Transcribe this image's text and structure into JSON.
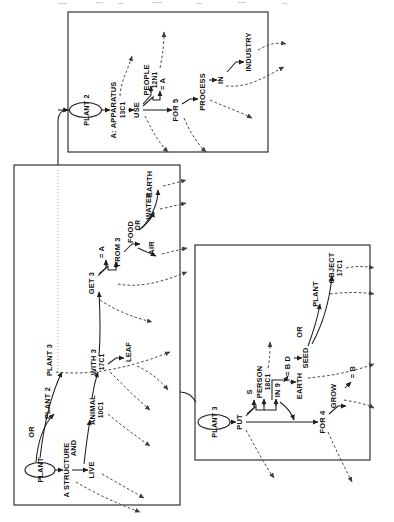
{
  "figure": {
    "orientation_deg": 90,
    "panels": [
      {
        "id": "panel-1",
        "name": "apparatus-panel",
        "x": 68,
        "y": 12,
        "w": 200,
        "h": 140
      },
      {
        "id": "panel-2",
        "name": "plant-structure-panel",
        "x": 14,
        "y": 165,
        "w": 166,
        "h": 340
      },
      {
        "id": "panel-3",
        "name": "planting-panel",
        "x": 195,
        "y": 245,
        "w": 175,
        "h": 215
      }
    ]
  },
  "panel1": {
    "root": "PLANT 2",
    "nodes": [
      {
        "name": "apparatus",
        "label": "A: APPARATUS",
        "code": "13C1"
      },
      {
        "name": "use",
        "label": "USE",
        "code": ""
      },
      {
        "name": "people",
        "label": "PEOPLE",
        "code": "12N1"
      },
      {
        "name": "equals-a",
        "label": "= A",
        "code": ""
      },
      {
        "name": "for-5",
        "label": "FOR 5",
        "code": ""
      },
      {
        "name": "process",
        "label": "PROCESS",
        "code": ""
      },
      {
        "name": "in",
        "label": "IN",
        "code": ""
      },
      {
        "name": "industry",
        "label": "INDUSTRY",
        "code": ""
      }
    ]
  },
  "panel2": {
    "root": "PLANT",
    "nodes": [
      {
        "name": "a-structure",
        "label": "A STRUCTURE",
        "code": ""
      },
      {
        "name": "and",
        "label": "AND",
        "code": ""
      },
      {
        "name": "or",
        "label": "OR",
        "code": ""
      },
      {
        "name": "live",
        "label": "LIVE",
        "code": ""
      },
      {
        "name": "plant-2",
        "label": "PLANT 2",
        "code": ""
      },
      {
        "name": "plant-3",
        "label": "PLANT 3",
        "code": ""
      },
      {
        "name": "animal",
        "label": "ANIMAL",
        "code": "10C1"
      },
      {
        "name": "with-3",
        "label": "WITH 3",
        "code": "17C1"
      },
      {
        "name": "leaf",
        "label": "LEAF",
        "code": ""
      },
      {
        "name": "get-3",
        "label": "GET 3",
        "code": ""
      },
      {
        "name": "equals-a",
        "label": "= A",
        "code": ""
      },
      {
        "name": "from-3",
        "label": "FROM 3",
        "code": ""
      },
      {
        "name": "food",
        "label": "FOOD",
        "code": ""
      },
      {
        "name": "or-2",
        "label": "OR",
        "code": ""
      },
      {
        "name": "air",
        "label": "AIR",
        "code": ""
      },
      {
        "name": "water",
        "label": "WATER",
        "code": ""
      },
      {
        "name": "earth",
        "label": "EARTH",
        "code": ""
      }
    ]
  },
  "panel3": {
    "root": "PLANT 3",
    "nodes": [
      {
        "name": "put",
        "label": "PUT",
        "code": ""
      },
      {
        "name": "s",
        "label": "S",
        "code": ""
      },
      {
        "name": "person",
        "label": "PERSON",
        "code": "18C1"
      },
      {
        "name": "in-9",
        "label": "IN 9",
        "code": ""
      },
      {
        "name": "equals-bd",
        "label": "= B D",
        "code": ""
      },
      {
        "name": "or",
        "label": "OR",
        "code": ""
      },
      {
        "name": "seed",
        "label": "SEED",
        "code": ""
      },
      {
        "name": "plant",
        "label": "PLANT",
        "code": ""
      },
      {
        "name": "object",
        "label": "OBJECT",
        "code": "17C1"
      },
      {
        "name": "earth",
        "label": "EARTH",
        "code": ""
      },
      {
        "name": "for-4",
        "label": "FOR 4",
        "code": ""
      },
      {
        "name": "grow",
        "label": "GROW",
        "code": ""
      },
      {
        "name": "equals-b",
        "label": "= B",
        "code": ""
      }
    ]
  }
}
